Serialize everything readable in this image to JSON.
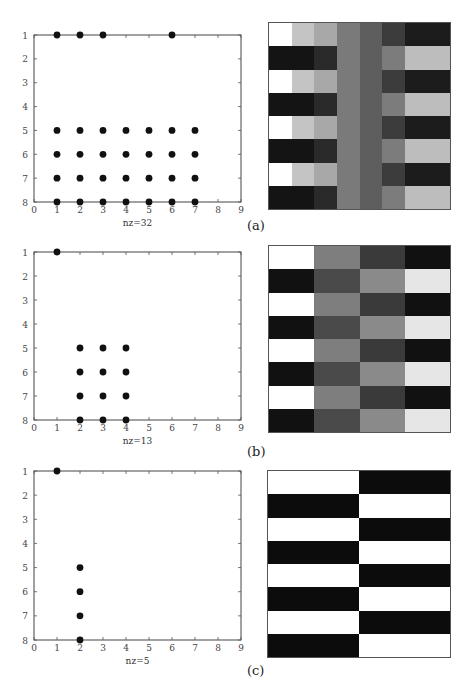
{
  "chart_data": [
    {
      "panel": "(a)",
      "type": "scatter",
      "subtype": "sparsity-pattern (spy)",
      "xlabel": "nz=32",
      "xlim": [
        0,
        9
      ],
      "ylim": [
        8,
        1
      ],
      "xticks": [
        0,
        1,
        2,
        3,
        4,
        5,
        6,
        7,
        8,
        9
      ],
      "yticks": [
        1,
        2,
        3,
        4,
        5,
        6,
        7,
        8
      ],
      "points": [
        [
          1,
          1
        ],
        [
          2,
          1
        ],
        [
          3,
          1
        ],
        [
          6,
          1
        ],
        [
          1,
          5
        ],
        [
          2,
          5
        ],
        [
          3,
          5
        ],
        [
          4,
          5
        ],
        [
          5,
          5
        ],
        [
          6,
          5
        ],
        [
          7,
          5
        ],
        [
          1,
          6
        ],
        [
          2,
          6
        ],
        [
          3,
          6
        ],
        [
          4,
          6
        ],
        [
          5,
          6
        ],
        [
          6,
          6
        ],
        [
          7,
          6
        ],
        [
          1,
          7
        ],
        [
          2,
          7
        ],
        [
          3,
          7
        ],
        [
          4,
          7
        ],
        [
          5,
          7
        ],
        [
          6,
          7
        ],
        [
          7,
          7
        ],
        [
          1,
          8
        ],
        [
          2,
          8
        ],
        [
          3,
          8
        ],
        [
          4,
          8
        ],
        [
          5,
          8
        ],
        [
          6,
          8
        ],
        [
          7,
          8
        ]
      ]
    },
    {
      "panel": "(a)",
      "type": "heatmap",
      "rows": 8,
      "cols": 8,
      "colormap": "grayscale",
      "values": [
        [
          "#ffffff",
          "#c4c4c4",
          "#a8a8a8",
          "#7a7a7a",
          "#5e5e5e",
          "#3c3c3c",
          "#1c1c1c",
          "#1c1c1c"
        ],
        [
          "#141414",
          "#141414",
          "#2a2a2a",
          "#7a7a7a",
          "#5e5e5e",
          "#7c7c7c",
          "#bdbdbd",
          "#bdbdbd"
        ],
        [
          "#ffffff",
          "#c4c4c4",
          "#a8a8a8",
          "#7a7a7a",
          "#5e5e5e",
          "#3c3c3c",
          "#1c1c1c",
          "#1c1c1c"
        ],
        [
          "#141414",
          "#141414",
          "#2a2a2a",
          "#7a7a7a",
          "#5e5e5e",
          "#7c7c7c",
          "#bdbdbd",
          "#bdbdbd"
        ],
        [
          "#ffffff",
          "#c4c4c4",
          "#a8a8a8",
          "#7a7a7a",
          "#5e5e5e",
          "#3c3c3c",
          "#1c1c1c",
          "#1c1c1c"
        ],
        [
          "#141414",
          "#141414",
          "#2a2a2a",
          "#7a7a7a",
          "#5e5e5e",
          "#7c7c7c",
          "#bdbdbd",
          "#bdbdbd"
        ],
        [
          "#ffffff",
          "#c4c4c4",
          "#a8a8a8",
          "#7a7a7a",
          "#5e5e5e",
          "#3c3c3c",
          "#1c1c1c",
          "#1c1c1c"
        ],
        [
          "#141414",
          "#141414",
          "#2a2a2a",
          "#7a7a7a",
          "#5e5e5e",
          "#7c7c7c",
          "#bdbdbd",
          "#bdbdbd"
        ]
      ]
    },
    {
      "panel": "(b)",
      "type": "scatter",
      "subtype": "sparsity-pattern (spy)",
      "xlabel": "nz=13",
      "xlim": [
        0,
        9
      ],
      "ylim": [
        8,
        1
      ],
      "xticks": [
        0,
        1,
        2,
        3,
        4,
        5,
        6,
        7,
        8,
        9
      ],
      "yticks": [
        1,
        2,
        3,
        4,
        5,
        6,
        7,
        8
      ],
      "points": [
        [
          1,
          1
        ],
        [
          2,
          5
        ],
        [
          3,
          5
        ],
        [
          4,
          5
        ],
        [
          2,
          6
        ],
        [
          3,
          6
        ],
        [
          4,
          6
        ],
        [
          2,
          7
        ],
        [
          3,
          7
        ],
        [
          4,
          7
        ],
        [
          2,
          8
        ],
        [
          3,
          8
        ],
        [
          4,
          8
        ]
      ]
    },
    {
      "panel": "(b)",
      "type": "heatmap",
      "rows": 8,
      "cols": 4,
      "colormap": "grayscale",
      "values": [
        [
          "#ffffff",
          "#7e7e7e",
          "#3a3a3a",
          "#111111"
        ],
        [
          "#111111",
          "#4a4a4a",
          "#8a8a8a",
          "#e6e6e6"
        ],
        [
          "#ffffff",
          "#7e7e7e",
          "#3a3a3a",
          "#111111"
        ],
        [
          "#111111",
          "#4a4a4a",
          "#8a8a8a",
          "#e6e6e6"
        ],
        [
          "#ffffff",
          "#7e7e7e",
          "#3a3a3a",
          "#111111"
        ],
        [
          "#111111",
          "#4a4a4a",
          "#8a8a8a",
          "#e6e6e6"
        ],
        [
          "#ffffff",
          "#7e7e7e",
          "#3a3a3a",
          "#111111"
        ],
        [
          "#111111",
          "#4a4a4a",
          "#8a8a8a",
          "#e6e6e6"
        ]
      ]
    },
    {
      "panel": "(c)",
      "type": "scatter",
      "subtype": "sparsity-pattern (spy)",
      "xlabel": "nz=5",
      "xlim": [
        0,
        9
      ],
      "ylim": [
        8,
        1
      ],
      "xticks": [
        0,
        1,
        2,
        3,
        4,
        5,
        6,
        7,
        8,
        9
      ],
      "yticks": [
        1,
        2,
        3,
        4,
        5,
        6,
        7,
        8
      ],
      "points": [
        [
          1,
          1
        ],
        [
          2,
          5
        ],
        [
          2,
          6
        ],
        [
          2,
          7
        ],
        [
          2,
          8
        ]
      ]
    },
    {
      "panel": "(c)",
      "type": "heatmap",
      "rows": 8,
      "cols": 2,
      "colormap": "grayscale",
      "values": [
        [
          "#ffffff",
          "#0c0c0c"
        ],
        [
          "#0c0c0c",
          "#ffffff"
        ],
        [
          "#ffffff",
          "#0c0c0c"
        ],
        [
          "#0c0c0c",
          "#ffffff"
        ],
        [
          "#ffffff",
          "#0c0c0c"
        ],
        [
          "#0c0c0c",
          "#ffffff"
        ],
        [
          "#ffffff",
          "#0c0c0c"
        ],
        [
          "#0c0c0c",
          "#ffffff"
        ]
      ]
    }
  ],
  "labels": {
    "a": "(a)",
    "b": "(b)",
    "c": "(c)"
  },
  "layout": {
    "spy_boxes": [
      {
        "left": 34,
        "top": 35,
        "right": 241,
        "bottom": 202
      },
      {
        "left": 34,
        "top": 252,
        "right": 241,
        "bottom": 420
      },
      {
        "left": 34,
        "top": 471,
        "right": 241,
        "bottom": 640
      }
    ],
    "heat_boxes": [
      {
        "left": 268,
        "top": 22,
        "right": 451,
        "bottom": 210
      },
      {
        "left": 268,
        "top": 245,
        "right": 451,
        "bottom": 433
      },
      {
        "left": 267,
        "top": 470,
        "right": 451,
        "bottom": 658
      }
    ],
    "label_pos": [
      {
        "left": 247,
        "top": 218
      },
      {
        "left": 247,
        "top": 444
      },
      {
        "left": 247,
        "top": 663
      }
    ]
  }
}
